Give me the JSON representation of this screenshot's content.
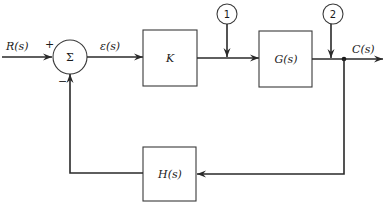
{
  "diagram": {
    "type": "feedback-control-block-diagram",
    "signals": {
      "input": "R(s)",
      "error": "ε(s)",
      "output": "C(s)"
    },
    "summing_junction": {
      "symbol": "Σ",
      "plus_sign": "+",
      "minus_sign": "−"
    },
    "blocks": {
      "controller": "K",
      "plant": "G(s)",
      "feedback": "H(s)"
    },
    "disturbance_points": [
      {
        "id": "1",
        "label": "1"
      },
      {
        "id": "2",
        "label": "2"
      }
    ],
    "colors": {
      "line": "#2a2a2a",
      "background": "#ffffff"
    }
  }
}
